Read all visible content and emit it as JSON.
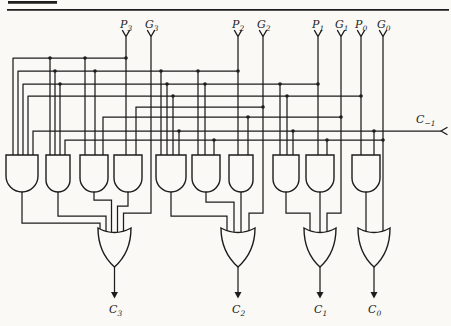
{
  "labels": {
    "p3": {
      "base": "P",
      "sub": "3"
    },
    "g3": {
      "base": "G",
      "sub": "3"
    },
    "p2": {
      "base": "P",
      "sub": "2"
    },
    "g2": {
      "base": "G",
      "sub": "2"
    },
    "p1": {
      "base": "P",
      "sub": "1"
    },
    "g1": {
      "base": "G",
      "sub": "1"
    },
    "p0": {
      "base": "P",
      "sub": "0"
    },
    "g0": {
      "base": "G",
      "sub": "0"
    },
    "cin": {
      "base": "C",
      "sub": "−1"
    },
    "c3": {
      "base": "C",
      "sub": "3"
    },
    "c2": {
      "base": "C",
      "sub": "2"
    },
    "c1": {
      "base": "C",
      "sub": "1"
    },
    "c0": {
      "base": "C",
      "sub": "0"
    }
  },
  "colors": {
    "ink": "#1d1d1d",
    "paper": "#faf9f6"
  }
}
